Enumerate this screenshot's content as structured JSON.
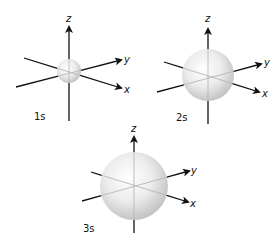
{
  "figure": {
    "colors": {
      "axis": "#111111",
      "axis_inside": "#b8b8b8",
      "sphere_highlight": "#ffffff",
      "sphere_mid": "#ececec",
      "sphere_edge": "#c4c4c4",
      "text": "#111111"
    },
    "orbitals": [
      {
        "id": "1s",
        "label": "1s",
        "label_pos": [
          34,
          120
        ],
        "center": [
          69,
          71
        ],
        "radius": 12,
        "z_axis": {
          "label": "z",
          "top": [
            69,
            27
          ],
          "bottom": [
            69,
            121
          ],
          "label_pos": [
            66,
            22
          ]
        },
        "y_axis": {
          "label": "y",
          "from": [
            16,
            87
          ],
          "to": [
            121,
            60
          ],
          "label_pos": [
            124,
            63
          ]
        },
        "x_axis": {
          "label": "x",
          "from": [
            24,
            58
          ],
          "to": [
            121,
            88
          ],
          "label_pos": [
            124,
            93
          ]
        }
      },
      {
        "id": "2s",
        "label": "2s",
        "label_pos": [
          176,
          121
        ],
        "center": [
          208,
          75
        ],
        "radius": 26,
        "z_axis": {
          "label": "z",
          "top": [
            208,
            29
          ],
          "bottom": [
            208,
            124
          ],
          "label_pos": [
            205,
            22
          ]
        },
        "y_axis": {
          "label": "y",
          "from": [
            157,
            92
          ],
          "to": [
            261,
            64
          ],
          "label_pos": [
            264,
            66
          ]
        },
        "x_axis": {
          "label": "x",
          "from": [
            164,
            62
          ],
          "to": [
            259,
            92
          ],
          "label_pos": [
            262,
            97
          ]
        }
      },
      {
        "id": "3s",
        "label": "3s",
        "label_pos": [
          83,
          232
        ],
        "center": [
          134,
          186
        ],
        "radius": 34,
        "z_axis": {
          "label": "z",
          "top": [
            134,
            137
          ],
          "bottom": [
            134,
            233
          ],
          "label_pos": [
            131,
            132
          ]
        },
        "y_axis": {
          "label": "y",
          "from": [
            82,
            201
          ],
          "to": [
            189,
            171
          ],
          "label_pos": [
            191,
            174
          ]
        },
        "x_axis": {
          "label": "x",
          "from": [
            91,
            172
          ],
          "to": [
            188,
            202
          ],
          "label_pos": [
            190,
            207
          ]
        }
      }
    ]
  }
}
